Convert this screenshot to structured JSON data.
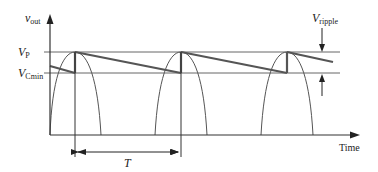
{
  "diagram": {
    "type": "rectified-ripple-waveform",
    "y_axis_label": {
      "main": "v",
      "sub": "out"
    },
    "x_axis_label": "Time",
    "levels": [
      {
        "name": "peak",
        "main": "V",
        "sub": "P"
      },
      {
        "name": "min",
        "main": "V",
        "sub": "Cmin"
      }
    ],
    "ripple_label": {
      "main": "V",
      "sub": "ripple"
    },
    "period_label": "T",
    "colors": {
      "axis": "#333333",
      "reference_lines": "#666666",
      "sine_arches": "#555555",
      "capacitor_voltage": "#555555"
    },
    "peaks_count": 3
  }
}
